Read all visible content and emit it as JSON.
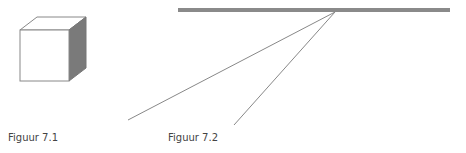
{
  "figures": [
    {
      "id": "7.1",
      "caption": "Figuur 7.1",
      "subject": "cube"
    },
    {
      "id": "7.2",
      "caption": "Figuur 7.2",
      "subject": "bar-with-converging-lines"
    }
  ],
  "colors": {
    "bar": "#8a8a8a",
    "cube_side": "#7a7a7a",
    "lines": "#888888",
    "caption": "#444444"
  }
}
